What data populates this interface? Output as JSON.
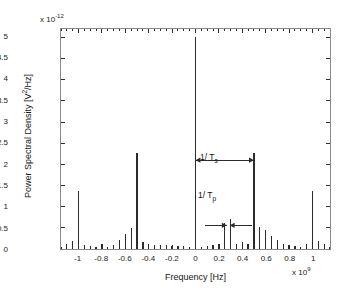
{
  "figure": {
    "y_exponent_prefix": "x 10",
    "y_exponent_value": "-12",
    "x_exponent_prefix": "x 10",
    "x_exponent_value": "9",
    "xlabel": "Frequency [Hz]",
    "ylabel_pre": "Power Spectral Density [V",
    "ylabel_sup": "2",
    "ylabel_post": "/Hz]"
  },
  "annotations": {
    "ts_pre": "1/ T",
    "ts_sub": "s",
    "tp_pre": "1/ T",
    "tp_sub": "p"
  },
  "chart_data": {
    "type": "bar",
    "title": "",
    "xlabel": "Frequency [Hz]",
    "ylabel": "Power Spectral Density [V^2/Hz]",
    "x_scale": 1000000000.0,
    "y_scale": 1e-12,
    "xlim": [
      -1.15,
      1.15
    ],
    "ylim": [
      0,
      5.2
    ],
    "xticks": [
      -1,
      -0.8,
      -0.6,
      -0.4,
      -0.2,
      0,
      0.2,
      0.4,
      0.6,
      0.8,
      1
    ],
    "xticklabels": [
      "-1",
      "-0.8",
      "-0.6",
      "-0.4",
      "-0.2",
      "0",
      "0.2",
      "0.4",
      "0.6",
      "0.8",
      "1"
    ],
    "yticks": [
      0,
      0.5,
      1,
      1.5,
      2,
      2.5,
      3,
      3.5,
      4,
      4.5,
      5
    ],
    "yticklabels": [
      "0",
      "0.5",
      "1",
      "1.5",
      "2",
      "2.5",
      "3",
      "3.5",
      "4",
      "4.5",
      "5"
    ],
    "grid": false,
    "legend": false,
    "line_color": "#2b2b2b",
    "spike_spacing": 0.05,
    "x": [
      -1.15,
      -1.1,
      -1.05,
      -1.0,
      -0.95,
      -0.9,
      -0.85,
      -0.8,
      -0.75,
      -0.7,
      -0.65,
      -0.6,
      -0.55,
      -0.5,
      -0.45,
      -0.4,
      -0.35,
      -0.3,
      -0.25,
      -0.2,
      -0.15,
      -0.1,
      -0.05,
      0.0,
      0.05,
      0.1,
      0.15,
      0.2,
      0.25,
      0.3,
      0.35,
      0.4,
      0.45,
      0.5,
      0.55,
      0.6,
      0.65,
      0.7,
      0.75,
      0.8,
      0.85,
      0.9,
      0.95,
      1.0,
      1.05,
      1.1,
      1.15
    ],
    "values": [
      0.05,
      0.12,
      0.18,
      1.38,
      0.1,
      0.08,
      0.05,
      0.12,
      0.04,
      0.1,
      0.22,
      0.35,
      0.5,
      2.28,
      0.17,
      0.12,
      0.1,
      0.09,
      0.09,
      0.08,
      0.07,
      0.06,
      0.05,
      5.0,
      0.05,
      0.07,
      0.09,
      0.12,
      0.62,
      0.72,
      0.13,
      0.16,
      0.11,
      2.28,
      0.52,
      0.45,
      0.3,
      0.22,
      0.12,
      0.1,
      0.06,
      0.05,
      0.12,
      1.38,
      0.2,
      0.12,
      0.05
    ],
    "markers": [
      {
        "name": "1/Ts",
        "from_x": 0.0,
        "to_x": 0.5,
        "y": 2.1,
        "style": "double-arrow-outward"
      },
      {
        "name": "1/Tp",
        "from_x": 0.2,
        "to_x": 0.36,
        "y": 0.56,
        "style": "double-arrow-inward"
      }
    ]
  }
}
